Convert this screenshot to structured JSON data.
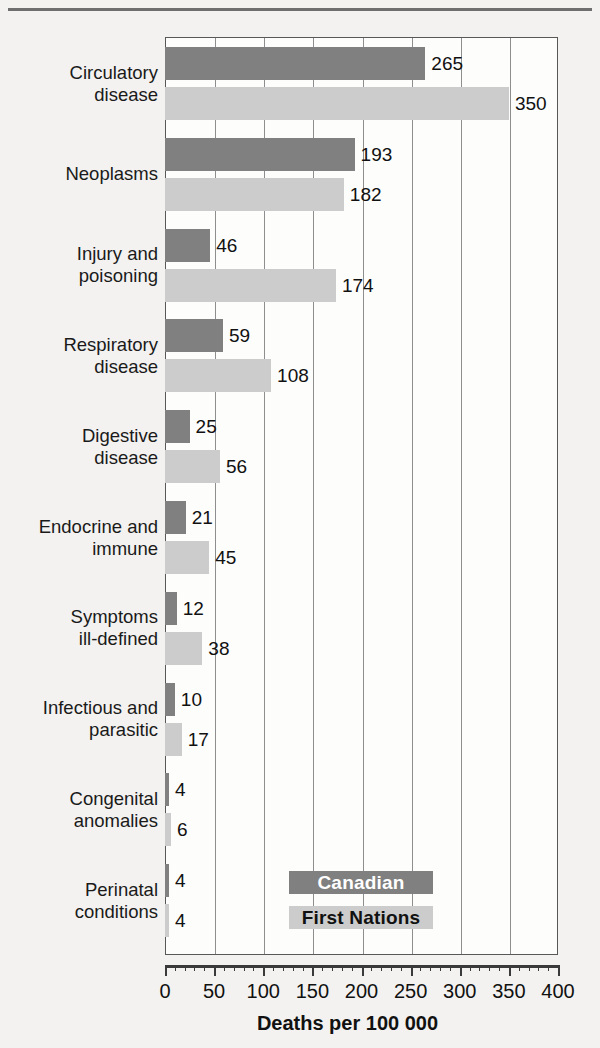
{
  "chart_data": {
    "type": "bar",
    "orientation": "horizontal",
    "title": "",
    "xlabel": "Deaths per 100 000",
    "ylabel": "",
    "xlim": [
      0,
      400
    ],
    "xticks": [
      0,
      50,
      100,
      150,
      200,
      250,
      300,
      350,
      400
    ],
    "xtick_labels": [
      "0",
      "50",
      "100",
      "150",
      "200",
      "250",
      "300",
      "350",
      "400"
    ],
    "minor_tick_interval": 10,
    "grid": true,
    "grid_axis": "x",
    "legend_position": "inside-bottom-right",
    "categories": [
      "Circulatory\ndisease",
      "Neoplasms",
      "Injury and\npoisoning",
      "Respiratory\ndisease",
      "Digestive\ndisease",
      "Endocrine and\nimmune",
      "Symptoms\nill-defined",
      "Infectious and\nparasitic",
      "Congenital\nanomalies",
      "Perinatal\nconditions"
    ],
    "series": [
      {
        "name": "Canadian",
        "color": "#808080",
        "text_color": "#ffffff",
        "values": [
          265,
          193,
          46,
          59,
          25,
          21,
          12,
          10,
          4,
          4
        ]
      },
      {
        "name": "First Nations",
        "color": "#cccccc",
        "text_color": "#111111",
        "values": [
          350,
          182,
          174,
          108,
          56,
          45,
          38,
          17,
          6,
          4
        ]
      }
    ]
  },
  "figure": {
    "background_color": "#f3f2f0",
    "plot_background_color": "#fdfdfc",
    "frame_color": "#585858",
    "gridline_color": "#8e8e8e",
    "top_rule_color": "#6f6f70"
  }
}
